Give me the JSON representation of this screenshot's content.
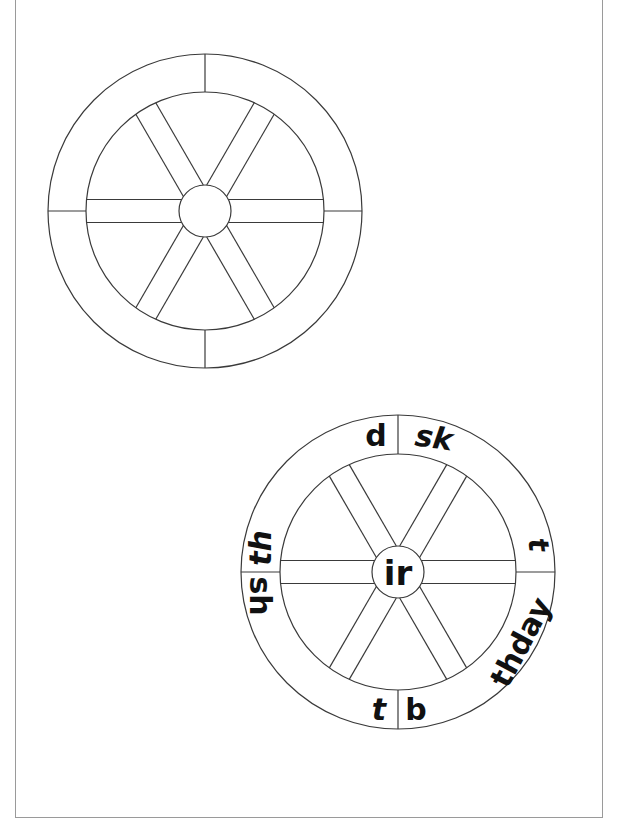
{
  "worksheet": {
    "blank_wheel": {
      "center": [
        205,
        211
      ],
      "outer_radius": 157,
      "inner_radius": 119,
      "hub_radius": 26,
      "spoke_count": 6,
      "rim_dividers": 4
    },
    "example_wheel": {
      "center": [
        398,
        572
      ],
      "outer_radius": 157,
      "inner_radius": 118,
      "hub_radius": 26,
      "hub_label": "ir",
      "rim_segments": [
        {
          "id": "d",
          "text": "d",
          "italic": false
        },
        {
          "id": "sk",
          "text": "sk",
          "italic": true
        },
        {
          "id": "t_right",
          "text": "t",
          "italic": true
        },
        {
          "id": "thday",
          "text": "thday",
          "italic": false
        },
        {
          "id": "b",
          "text": "b",
          "italic": false
        },
        {
          "id": "t_bottom",
          "text": "t",
          "italic": true
        },
        {
          "id": "sh",
          "text": "sh",
          "italic": false
        },
        {
          "id": "th",
          "text": "th",
          "italic": true
        }
      ]
    },
    "colors": {
      "line": "#3a3a3a",
      "text": "#111111",
      "frame": "#9a9a9a",
      "background": "#ffffff"
    }
  }
}
